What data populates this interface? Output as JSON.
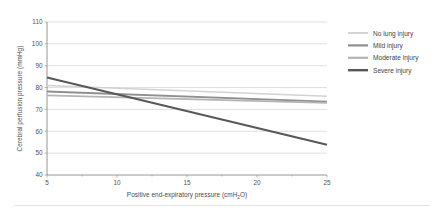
{
  "chart_data": {
    "type": "line",
    "title": "",
    "xlabel": "Positive end-expiratory pressure (cmH₂O)",
    "xlabel_main": "Positive end-expiratory pressure (cmH",
    "xlabel_sub": "2",
    "xlabel_tail": "O)",
    "ylabel": "Cerebral perfusion pressure (mmHg)",
    "xlim": [
      5,
      25
    ],
    "ylim": [
      40,
      110
    ],
    "xticks": [
      5,
      10,
      15,
      20,
      25
    ],
    "xtick_labels": [
      "5",
      "10",
      "15",
      "20",
      "25"
    ],
    "yticks": [
      40,
      50,
      60,
      70,
      80,
      90,
      100,
      110
    ],
    "ytick_labels": [
      "40",
      "50",
      "60",
      "70",
      "80",
      "90",
      "100",
      "110"
    ],
    "x_minor_ticks": [
      7.5,
      12.5,
      17.5,
      22.5
    ],
    "grid": true,
    "grid_axis": "y",
    "legend_position": "right",
    "x": [
      5,
      25
    ],
    "series": [
      {
        "name": "No lung injury",
        "values": [
          81.0,
          76.0
        ],
        "color": "#d2d2d2",
        "width": 1.5
      },
      {
        "name": "Mild injury",
        "values": [
          78.2,
          73.6
        ],
        "color": "#8f8f8f",
        "width": 1.8
      },
      {
        "name": "Moderate injury",
        "values": [
          76.4,
          73.0
        ],
        "color": "#b4b4b4",
        "width": 1.8
      },
      {
        "name": "Severe injury",
        "values": [
          84.6,
          53.8
        ],
        "color": "#585858",
        "width": 2.0
      }
    ]
  },
  "legend": {
    "items": [
      {
        "label": "No lung injury"
      },
      {
        "label": "Mild injury"
      },
      {
        "label": "Moderate injury"
      },
      {
        "label": "Severe injury"
      }
    ]
  }
}
